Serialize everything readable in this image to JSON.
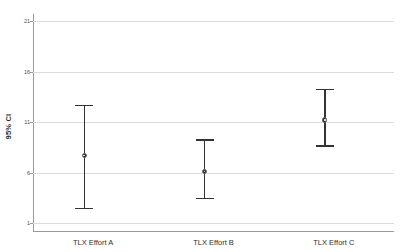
{
  "chart_data": {
    "type": "scatter",
    "title": "",
    "subtitle": "",
    "xlabel": "",
    "ylabel": "95% CI",
    "categories": [
      "TLX Effort A",
      "TLX Effort B",
      "TLX Effort C"
    ],
    "ylim": [
      1,
      21
    ],
    "yticks": [
      1,
      6,
      11,
      16,
      21
    ],
    "ytick_labels": [
      "1",
      "6",
      "11",
      "16",
      "21"
    ],
    "grid": true,
    "legend": "none",
    "series": [
      {
        "name": "Mean with 95% CI",
        "points": [
          {
            "category": "TLX Effort A",
            "mean": 7.7,
            "ci_lower": 2.5,
            "ci_upper": 12.7
          },
          {
            "category": "TLX Effort B",
            "mean": 6.1,
            "ci_lower": 3.5,
            "ci_upper": 9.3
          },
          {
            "category": "TLX Effort C",
            "mean": 11.2,
            "ci_lower": 8.7,
            "ci_upper": 14.3
          }
        ]
      }
    ],
    "colors": {
      "marker": "#2b2b2b",
      "errorbar": "#333333",
      "gridline": "#dcdcdc",
      "axis": "#9a9a9a",
      "text": "#2f2f2f",
      "background": "#ffffff"
    }
  }
}
